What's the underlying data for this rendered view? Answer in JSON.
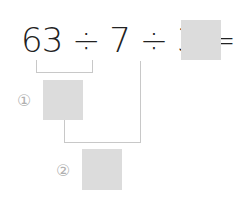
{
  "equation": {
    "text": "63 ÷ 7 ÷ 3 ="
  },
  "steps": [
    {
      "label": "①"
    },
    {
      "label": "②"
    }
  ],
  "colors": {
    "box": "#dcdcdc",
    "line": "#c8c8c8",
    "text": "#222222",
    "marker": "#b0b0b0"
  }
}
